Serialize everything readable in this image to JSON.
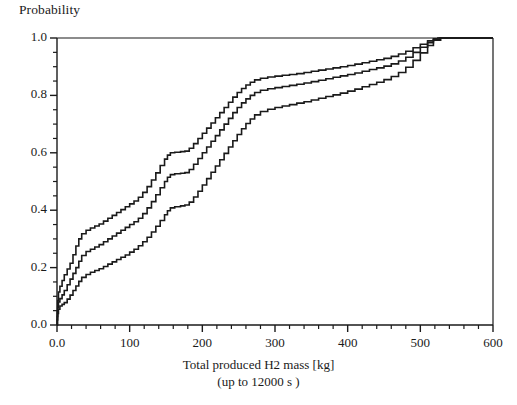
{
  "chart_data": {
    "type": "line",
    "title": "",
    "ylabel": "Probability",
    "xlabel": "Total produced H2 mass [kg]",
    "xsublabel": "(up to 12000 s )",
    "xlim": [
      0,
      600
    ],
    "ylim": [
      0,
      1.0
    ],
    "xticks": [
      0,
      100,
      200,
      300,
      400,
      500,
      600
    ],
    "xtick_labels": [
      "0.0",
      "100",
      "200",
      "300",
      "400",
      "500",
      "600"
    ],
    "yticks": [
      0.0,
      0.2,
      0.4,
      0.6,
      0.8,
      1.0
    ],
    "ytick_labels": [
      "0.0",
      "0.2",
      "0.4",
      "0.6",
      "0.8",
      "1.0"
    ],
    "x_minor_interval": 20,
    "y_minor_interval": 0.05,
    "grid": false,
    "legend": "none",
    "line_color": "#1a1a1a",
    "line_width": 1.6,
    "series": [
      {
        "name": "upper-bound",
        "points": [
          [
            0,
            0.0
          ],
          [
            0.5,
            0.045
          ],
          [
            1,
            0.085
          ],
          [
            2,
            0.115
          ],
          [
            4,
            0.135
          ],
          [
            7,
            0.155
          ],
          [
            10,
            0.175
          ],
          [
            14,
            0.195
          ],
          [
            18,
            0.215
          ],
          [
            22,
            0.245
          ],
          [
            26,
            0.275
          ],
          [
            30,
            0.3
          ],
          [
            34,
            0.318
          ],
          [
            40,
            0.33
          ],
          [
            46,
            0.338
          ],
          [
            52,
            0.345
          ],
          [
            58,
            0.352
          ],
          [
            64,
            0.362
          ],
          [
            70,
            0.372
          ],
          [
            76,
            0.382
          ],
          [
            82,
            0.392
          ],
          [
            88,
            0.402
          ],
          [
            94,
            0.412
          ],
          [
            100,
            0.422
          ],
          [
            106,
            0.432
          ],
          [
            112,
            0.445
          ],
          [
            118,
            0.462
          ],
          [
            124,
            0.482
          ],
          [
            130,
            0.505
          ],
          [
            136,
            0.53
          ],
          [
            142,
            0.556
          ],
          [
            148,
            0.578
          ],
          [
            152,
            0.592
          ],
          [
            156,
            0.6
          ],
          [
            162,
            0.602
          ],
          [
            170,
            0.604
          ],
          [
            176,
            0.606
          ],
          [
            182,
            0.616
          ],
          [
            188,
            0.632
          ],
          [
            194,
            0.65
          ],
          [
            200,
            0.668
          ],
          [
            206,
            0.686
          ],
          [
            212,
            0.704
          ],
          [
            218,
            0.722
          ],
          [
            224,
            0.74
          ],
          [
            230,
            0.758
          ],
          [
            236,
            0.776
          ],
          [
            242,
            0.794
          ],
          [
            248,
            0.81
          ],
          [
            254,
            0.824
          ],
          [
            260,
            0.836
          ],
          [
            266,
            0.846
          ],
          [
            272,
            0.854
          ],
          [
            280,
            0.86
          ],
          [
            290,
            0.864
          ],
          [
            300,
            0.867
          ],
          [
            310,
            0.87
          ],
          [
            320,
            0.873
          ],
          [
            330,
            0.876
          ],
          [
            340,
            0.88
          ],
          [
            350,
            0.884
          ],
          [
            360,
            0.888
          ],
          [
            370,
            0.892
          ],
          [
            380,
            0.896
          ],
          [
            390,
            0.9
          ],
          [
            400,
            0.904
          ],
          [
            410,
            0.909
          ],
          [
            420,
            0.914
          ],
          [
            430,
            0.919
          ],
          [
            440,
            0.924
          ],
          [
            450,
            0.929
          ],
          [
            460,
            0.936
          ],
          [
            470,
            0.944
          ],
          [
            480,
            0.954
          ],
          [
            490,
            0.966
          ],
          [
            500,
            0.978
          ],
          [
            510,
            0.99
          ],
          [
            518,
            0.997
          ],
          [
            524,
            1.0
          ],
          [
            600,
            1.0
          ]
        ]
      },
      {
        "name": "median",
        "points": [
          [
            0,
            0.0
          ],
          [
            0.5,
            0.03
          ],
          [
            1,
            0.062
          ],
          [
            2,
            0.08
          ],
          [
            4,
            0.092
          ],
          [
            7,
            0.105
          ],
          [
            10,
            0.12
          ],
          [
            14,
            0.14
          ],
          [
            18,
            0.16
          ],
          [
            22,
            0.18
          ],
          [
            26,
            0.2
          ],
          [
            30,
            0.222
          ],
          [
            34,
            0.242
          ],
          [
            40,
            0.256
          ],
          [
            46,
            0.264
          ],
          [
            52,
            0.272
          ],
          [
            58,
            0.28
          ],
          [
            64,
            0.29
          ],
          [
            70,
            0.3
          ],
          [
            76,
            0.31
          ],
          [
            82,
            0.32
          ],
          [
            88,
            0.33
          ],
          [
            94,
            0.34
          ],
          [
            100,
            0.35
          ],
          [
            106,
            0.36
          ],
          [
            112,
            0.372
          ],
          [
            118,
            0.388
          ],
          [
            124,
            0.408
          ],
          [
            130,
            0.43
          ],
          [
            136,
            0.454
          ],
          [
            142,
            0.478
          ],
          [
            148,
            0.5
          ],
          [
            152,
            0.515
          ],
          [
            156,
            0.524
          ],
          [
            162,
            0.527
          ],
          [
            170,
            0.529
          ],
          [
            176,
            0.531
          ],
          [
            182,
            0.542
          ],
          [
            188,
            0.56
          ],
          [
            194,
            0.58
          ],
          [
            200,
            0.6
          ],
          [
            206,
            0.62
          ],
          [
            212,
            0.64
          ],
          [
            218,
            0.66
          ],
          [
            224,
            0.68
          ],
          [
            230,
            0.7
          ],
          [
            236,
            0.72
          ],
          [
            242,
            0.74
          ],
          [
            248,
            0.758
          ],
          [
            254,
            0.774
          ],
          [
            260,
            0.788
          ],
          [
            266,
            0.8
          ],
          [
            272,
            0.81
          ],
          [
            280,
            0.818
          ],
          [
            290,
            0.823
          ],
          [
            300,
            0.827
          ],
          [
            310,
            0.831
          ],
          [
            320,
            0.835
          ],
          [
            330,
            0.839
          ],
          [
            340,
            0.843
          ],
          [
            350,
            0.848
          ],
          [
            360,
            0.853
          ],
          [
            370,
            0.858
          ],
          [
            380,
            0.863
          ],
          [
            390,
            0.868
          ],
          [
            400,
            0.873
          ],
          [
            410,
            0.878
          ],
          [
            420,
            0.884
          ],
          [
            430,
            0.89
          ],
          [
            440,
            0.896
          ],
          [
            450,
            0.902
          ],
          [
            460,
            0.91
          ],
          [
            470,
            0.92
          ],
          [
            480,
            0.933
          ],
          [
            490,
            0.95
          ],
          [
            500,
            0.968
          ],
          [
            510,
            0.984
          ],
          [
            518,
            0.995
          ],
          [
            526,
            1.0
          ],
          [
            600,
            1.0
          ]
        ]
      },
      {
        "name": "lower-bound",
        "points": [
          [
            0,
            0.0
          ],
          [
            0.5,
            0.018
          ],
          [
            1,
            0.04
          ],
          [
            2,
            0.055
          ],
          [
            4,
            0.066
          ],
          [
            7,
            0.072
          ],
          [
            10,
            0.078
          ],
          [
            14,
            0.09
          ],
          [
            18,
            0.104
          ],
          [
            22,
            0.12
          ],
          [
            26,
            0.136
          ],
          [
            30,
            0.152
          ],
          [
            34,
            0.166
          ],
          [
            40,
            0.176
          ],
          [
            46,
            0.184
          ],
          [
            52,
            0.19
          ],
          [
            58,
            0.196
          ],
          [
            64,
            0.204
          ],
          [
            70,
            0.212
          ],
          [
            76,
            0.22
          ],
          [
            82,
            0.228
          ],
          [
            88,
            0.236
          ],
          [
            94,
            0.244
          ],
          [
            100,
            0.254
          ],
          [
            106,
            0.264
          ],
          [
            112,
            0.276
          ],
          [
            118,
            0.29
          ],
          [
            124,
            0.306
          ],
          [
            130,
            0.324
          ],
          [
            136,
            0.344
          ],
          [
            142,
            0.364
          ],
          [
            148,
            0.384
          ],
          [
            152,
            0.398
          ],
          [
            156,
            0.408
          ],
          [
            162,
            0.412
          ],
          [
            170,
            0.415
          ],
          [
            176,
            0.418
          ],
          [
            182,
            0.428
          ],
          [
            188,
            0.446
          ],
          [
            194,
            0.466
          ],
          [
            200,
            0.488
          ],
          [
            206,
            0.51
          ],
          [
            212,
            0.532
          ],
          [
            218,
            0.554
          ],
          [
            224,
            0.576
          ],
          [
            230,
            0.598
          ],
          [
            236,
            0.62
          ],
          [
            242,
            0.642
          ],
          [
            248,
            0.664
          ],
          [
            254,
            0.684
          ],
          [
            260,
            0.702
          ],
          [
            266,
            0.718
          ],
          [
            272,
            0.732
          ],
          [
            280,
            0.744
          ],
          [
            290,
            0.752
          ],
          [
            300,
            0.758
          ],
          [
            310,
            0.763
          ],
          [
            320,
            0.768
          ],
          [
            330,
            0.773
          ],
          [
            340,
            0.778
          ],
          [
            350,
            0.784
          ],
          [
            360,
            0.79
          ],
          [
            370,
            0.796
          ],
          [
            380,
            0.802
          ],
          [
            390,
            0.808
          ],
          [
            400,
            0.815
          ],
          [
            410,
            0.822
          ],
          [
            420,
            0.83
          ],
          [
            430,
            0.838
          ],
          [
            440,
            0.846
          ],
          [
            450,
            0.855
          ],
          [
            460,
            0.866
          ],
          [
            470,
            0.88
          ],
          [
            480,
            0.898
          ],
          [
            490,
            0.922
          ],
          [
            500,
            0.948
          ],
          [
            510,
            0.974
          ],
          [
            518,
            0.992
          ],
          [
            528,
            1.0
          ],
          [
            600,
            1.0
          ]
        ]
      }
    ]
  },
  "plot_geometry": {
    "left": 57,
    "right": 493,
    "top": 38,
    "bottom": 325
  }
}
